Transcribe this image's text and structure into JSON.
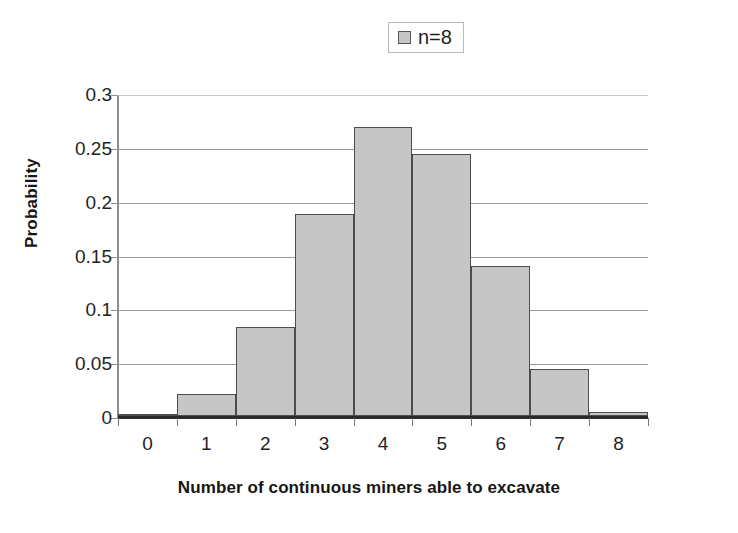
{
  "legend": {
    "entries": [
      {
        "label": "n=8",
        "swatch_color": "#c6c6c6",
        "icon": "square-marker-icon"
      }
    ],
    "position": "top-center",
    "bordered": true
  },
  "axes": {
    "ylabel": "Probability",
    "xlabel": "Number of continuous miners able to excavate",
    "y_ticks": [
      "0",
      "0.05",
      "0.1",
      "0.15",
      "0.2",
      "0.25",
      "0.3"
    ],
    "x_ticks": [
      "0",
      "1",
      "2",
      "3",
      "4",
      "5",
      "6",
      "7",
      "8"
    ]
  },
  "colors": {
    "bar_fill": "#c6c6c6",
    "bar_border": "#4d4d4d",
    "gridline": "#9a9a9a",
    "axis": "#2b2b2b",
    "text": "#1f1f1f",
    "background": "#ffffff"
  },
  "chart_data": {
    "type": "bar",
    "title": "",
    "subtitle": "",
    "xlabel": "Number of continuous miners able to excavate",
    "ylabel": "Probability",
    "categories": [
      "0",
      "1",
      "2",
      "3",
      "4",
      "5",
      "6",
      "7",
      "8"
    ],
    "series": [
      {
        "name": "n=8",
        "values": [
          0.001,
          0.02,
          0.083,
          0.188,
          0.268,
          0.243,
          0.139,
          0.044,
          0.004
        ]
      }
    ],
    "values": [
      0.001,
      0.02,
      0.083,
      0.188,
      0.268,
      0.243,
      0.139,
      0.044,
      0.004
    ],
    "ylim": [
      0,
      0.3
    ],
    "ytick_values": [
      0,
      0.05,
      0.1,
      0.15,
      0.2,
      0.25,
      0.3
    ],
    "grid": "horizontal",
    "legend_position": "top-center",
    "bar_gap": 0
  }
}
